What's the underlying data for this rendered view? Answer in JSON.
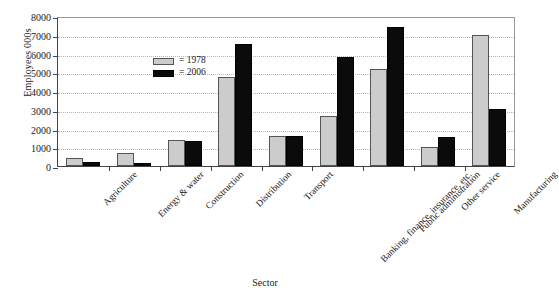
{
  "chart_data": {
    "type": "bar",
    "title": "",
    "xlabel": "Sector",
    "ylabel": "Employees 000s",
    "ylim": [
      0,
      8000
    ],
    "yticks": [
      0,
      1000,
      2000,
      3000,
      4000,
      5000,
      6000,
      7000,
      8000
    ],
    "ytick_labels": [
      "0",
      "1000",
      "2000",
      "3000",
      "4000",
      "5000",
      "6000",
      "7000",
      "8000"
    ],
    "grid": true,
    "legend_position": "upper left inside",
    "categories": [
      "Agriculture",
      "Energy & water",
      "Construction",
      "Distribution",
      "Transport",
      "Banking, finance, insurance, etc.",
      "Public administration",
      "Other service",
      "Manufacturing"
    ],
    "series": [
      {
        "name": "1978",
        "legend_label": "= 1978",
        "color": "#cccccc",
        "values": [
          450,
          700,
          1400,
          4750,
          1600,
          2650,
          5200,
          1000,
          7000
        ]
      },
      {
        "name": "2006",
        "legend_label": "= 2006",
        "color": "#0b0b0b",
        "values": [
          230,
          180,
          1350,
          6500,
          1600,
          5800,
          7400,
          1550,
          3050
        ]
      }
    ]
  },
  "axes": {
    "y_title": "Employees 000s",
    "x_title": "Sector"
  }
}
